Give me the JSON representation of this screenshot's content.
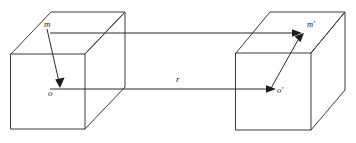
{
  "figure": {
    "name": "two-cubes-vector-diagram",
    "background_color": "#ffffff",
    "stroke_color": "#3a3a3a",
    "vector_color": "#1c1c1c",
    "labels": {
      "m": "m",
      "o": "o",
      "r": "r",
      "m_prime": "m′",
      "o_prime": "o′"
    }
  },
  "left_cube": {
    "name": "left-cube",
    "front_face": {
      "left": 11,
      "right": 85,
      "top": 54,
      "bottom": 129
    },
    "depth_offset": {
      "dx": 40,
      "dy": -42
    }
  },
  "right_cube": {
    "name": "right-cube",
    "front_face": {
      "left": 236,
      "right": 311,
      "top": 53,
      "bottom": 130
    },
    "depth_offset": {
      "dx": 34,
      "dy": -41
    }
  },
  "vectors": [
    {
      "name": "m-to-o",
      "label": "m",
      "from": [
        48,
        30
      ],
      "to": [
        60,
        86
      ]
    },
    {
      "name": "top-connector",
      "label": "",
      "from": [
        50,
        33
      ],
      "to": [
        301,
        33
      ]
    },
    {
      "name": "r-connector",
      "label": "r",
      "from": [
        50,
        89
      ],
      "to": [
        276,
        89
      ]
    },
    {
      "name": "o-prime-to-m-prime",
      "label": "m′",
      "from": [
        271,
        89
      ],
      "to": [
        304,
        33
      ]
    }
  ]
}
